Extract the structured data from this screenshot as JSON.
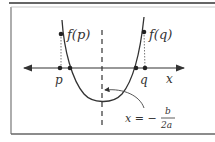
{
  "diagram": {
    "type": "parabola-roots-diagram",
    "labels": {
      "f_p": "f(p)",
      "f_q": "f(q)",
      "p": "p",
      "q": "q",
      "x_axis": "x",
      "axis_of_symmetry_lhs": "x = −",
      "frac_num": "b",
      "frac_den": "2a"
    },
    "colors": {
      "stroke": "#333333",
      "frame": "#555555",
      "background": "#ffffff"
    }
  }
}
